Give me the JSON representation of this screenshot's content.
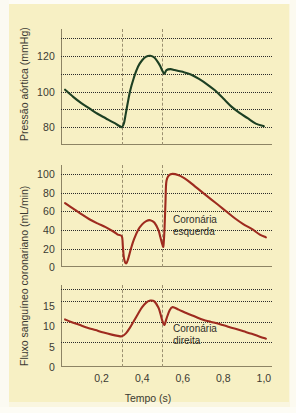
{
  "figure": {
    "background_color": "#f7f0c4",
    "axis_color": "#8d8464",
    "grid_color": "#2b2b2b",
    "marker_line_color": "#9b9070"
  },
  "axes": {
    "x_label": "Tempo (s)",
    "x_ticks": [
      "0,2",
      "0,4",
      "0,6",
      "0,8",
      "1,0"
    ],
    "y_label_top": "Pressão aórtica (mmHg)",
    "y_label_bottom": "Fluxo sanguíneo coronariano (mL/min)"
  },
  "annotations": {
    "left_coronary_line1": "Coronária",
    "left_coronary_line2": "esquerda",
    "right_coronary_line1": "Coronária",
    "right_coronary_line2": "direita"
  },
  "panel1_yticks": [
    "120",
    "100",
    "80"
  ],
  "panel2_yticks": [
    "100",
    "80",
    "60",
    "40",
    "20",
    "0"
  ],
  "panel3_yticks": [
    "15",
    "10",
    "5",
    "0"
  ],
  "chart_data": [
    {
      "type": "line",
      "title": "Pressão aórtica",
      "xlabel": "Tempo (s)",
      "ylabel": "Pressão aórtica (mmHg)",
      "xlim": [
        0.0,
        1.04
      ],
      "ylim": [
        70,
        135
      ],
      "grid": true,
      "grid_values": [
        130,
        120,
        110,
        100,
        90,
        80
      ],
      "tick_values": [
        120,
        100,
        80
      ],
      "line_color": "#1d4023",
      "marker_lines": [
        0.3,
        0.5
      ],
      "series": [
        {
          "name": "Pressão aórtica",
          "x": [
            0.02,
            0.06,
            0.1,
            0.14,
            0.18,
            0.22,
            0.26,
            0.29,
            0.3,
            0.31,
            0.32,
            0.34,
            0.36,
            0.38,
            0.4,
            0.42,
            0.44,
            0.46,
            0.48,
            0.49,
            0.5,
            0.51,
            0.52,
            0.54,
            0.56,
            0.58,
            0.6,
            0.64,
            0.68,
            0.72,
            0.76,
            0.8,
            0.84,
            0.88,
            0.92,
            0.96,
            1.0
          ],
          "y": [
            101,
            97,
            93.5,
            90.5,
            87.5,
            85,
            82.5,
            80.5,
            80,
            82,
            88,
            100,
            108,
            114,
            117.5,
            119.5,
            120,
            119,
            116,
            114,
            111.5,
            110,
            112,
            112.5,
            112,
            111.5,
            111,
            109.5,
            107,
            104,
            100.5,
            96,
            91.5,
            88,
            85,
            82,
            80.5
          ]
        }
      ]
    },
    {
      "type": "line",
      "title": "Coronária esquerda",
      "xlabel": "Tempo (s)",
      "ylabel": "Fluxo sanguíneo coronariano (mL/min)",
      "xlim": [
        0.0,
        1.04
      ],
      "ylim": [
        0,
        110
      ],
      "grid": true,
      "grid_values": [
        100,
        80,
        60,
        40,
        20
      ],
      "tick_values": [
        100,
        80,
        60,
        40,
        20,
        0
      ],
      "line_color": "#9e2b1f",
      "marker_lines": [
        0.3,
        0.5
      ],
      "series": [
        {
          "name": "Coronária esquerda",
          "x": [
            0.02,
            0.06,
            0.1,
            0.14,
            0.18,
            0.22,
            0.26,
            0.28,
            0.3,
            0.305,
            0.31,
            0.32,
            0.33,
            0.345,
            0.36,
            0.38,
            0.4,
            0.42,
            0.44,
            0.46,
            0.48,
            0.49,
            0.5,
            0.505,
            0.51,
            0.515,
            0.52,
            0.54,
            0.58,
            0.62,
            0.66,
            0.7,
            0.74,
            0.78,
            0.82,
            0.86,
            0.9,
            0.94,
            0.98,
            1.01
          ],
          "y": [
            69,
            63,
            57,
            51.5,
            47,
            43,
            38,
            35,
            33,
            22,
            10,
            4,
            8,
            20,
            30,
            40,
            46,
            49.5,
            50.5,
            48,
            40,
            32,
            24,
            23,
            40,
            70,
            93,
            100,
            99,
            94,
            87,
            80,
            73,
            66,
            59,
            52,
            46,
            41,
            35,
            32
          ]
        }
      ]
    },
    {
      "type": "line",
      "title": "Coronária direita",
      "xlabel": "Tempo (s)",
      "ylabel": "Fluxo sanguíneo coronariano (mL/min)",
      "xlim": [
        0.0,
        1.04
      ],
      "ylim": [
        0,
        20
      ],
      "grid": true,
      "grid_values": [
        19,
        16,
        11,
        6
      ],
      "tick_values": [
        15,
        10,
        5,
        0
      ],
      "line_color": "#9e2b1f",
      "marker_lines": [
        0.3,
        0.5
      ],
      "series": [
        {
          "name": "Coronária direita",
          "x": [
            0.02,
            0.05,
            0.09,
            0.13,
            0.17,
            0.21,
            0.25,
            0.28,
            0.3,
            0.32,
            0.34,
            0.36,
            0.38,
            0.4,
            0.42,
            0.44,
            0.46,
            0.48,
            0.49,
            0.5,
            0.51,
            0.52,
            0.535,
            0.55,
            0.58,
            0.62,
            0.66,
            0.7,
            0.74,
            0.78,
            0.82,
            0.86,
            0.9,
            0.94,
            0.98,
            1.01
          ],
          "y": [
            11.6,
            11.0,
            10.3,
            9.6,
            9.0,
            8.4,
            7.9,
            7.6,
            7.5,
            8.2,
            9.6,
            11.3,
            13.0,
            14.6,
            15.7,
            16.2,
            16.0,
            14.5,
            13.0,
            11.2,
            10.3,
            11.8,
            13.8,
            14.6,
            14.0,
            13.1,
            12.3,
            11.5,
            11.0,
            10.5,
            9.9,
            9.3,
            8.7,
            8.1,
            7.4,
            6.9
          ]
        }
      ]
    }
  ]
}
